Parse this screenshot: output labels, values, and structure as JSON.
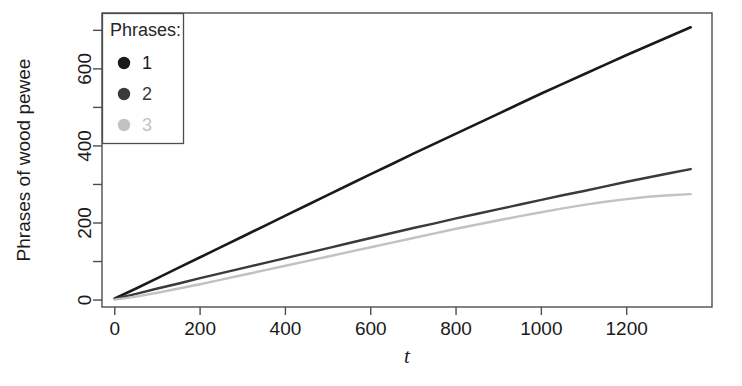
{
  "chart_data": {
    "type": "line",
    "title": "",
    "xlabel": "t",
    "ylabel": "Phrases of wood pewee",
    "xlim": [
      -30,
      1400
    ],
    "ylim": [
      -18,
      745
    ],
    "grid": false,
    "legend_position": "top-left",
    "legend_title": "Phrases:",
    "xticks": [
      0,
      200,
      400,
      600,
      800,
      1000,
      1200
    ],
    "xtick_labels": [
      "0",
      "200",
      "400",
      "600",
      "800",
      "1000",
      "1200"
    ],
    "yticks": [
      0,
      200,
      400,
      600
    ],
    "ytick_labels": [
      "0",
      "200",
      "400",
      "600"
    ],
    "yticks_minor": [
      100,
      300,
      500,
      700
    ],
    "series": [
      {
        "name": "1",
        "label": "1",
        "color": "#1a1a1a",
        "marker": "circle",
        "linewidth": 2.6,
        "x": [
          0,
          50,
          100,
          150,
          200,
          250,
          300,
          350,
          400,
          450,
          500,
          550,
          600,
          650,
          700,
          750,
          800,
          850,
          900,
          950,
          1000,
          1050,
          1100,
          1150,
          1200,
          1250,
          1300,
          1350
        ],
        "y": [
          4,
          30,
          57,
          84,
          111,
          138,
          165,
          192,
          219,
          246,
          273,
          300,
          327,
          353,
          380,
          406,
          432,
          458,
          484,
          510,
          536,
          561,
          586,
          611,
          636,
          660,
          684,
          708
        ]
      },
      {
        "name": "2",
        "label": "2",
        "color": "#3a3a3a",
        "marker": "circle",
        "linewidth": 2.4,
        "x": [
          0,
          50,
          100,
          150,
          200,
          250,
          300,
          350,
          400,
          450,
          500,
          550,
          600,
          650,
          700,
          750,
          800,
          850,
          900,
          950,
          1000,
          1050,
          1100,
          1150,
          1200,
          1250,
          1300,
          1350
        ],
        "y": [
          3,
          16,
          30,
          43,
          57,
          70,
          83,
          96,
          109,
          122,
          135,
          148,
          161,
          174,
          187,
          199,
          212,
          224,
          236,
          248,
          260,
          272,
          283,
          295,
          307,
          318,
          329,
          340
        ]
      },
      {
        "name": "3",
        "label": "3",
        "color": "#c2c2c2",
        "marker": "circle",
        "linewidth": 2.4,
        "x": [
          0,
          50,
          100,
          150,
          200,
          250,
          300,
          350,
          400,
          450,
          500,
          550,
          600,
          650,
          700,
          750,
          800,
          850,
          900,
          950,
          1000,
          1050,
          1100,
          1150,
          1200,
          1250,
          1300,
          1350
        ],
        "y": [
          1,
          9,
          19,
          30,
          41,
          53,
          65,
          77,
          89,
          101,
          113,
          125,
          137,
          149,
          161,
          173,
          185,
          196,
          207,
          218,
          228,
          238,
          247,
          255,
          262,
          268,
          272,
          275
        ]
      }
    ]
  },
  "axes": {
    "y_axis_title": "Phrases of wood pewee",
    "x_axis_title": "t"
  },
  "legend": {
    "title": "Phrases:",
    "entries": [
      {
        "label": "1",
        "color": "#1a1a1a"
      },
      {
        "label": "2",
        "color": "#3a3a3a"
      },
      {
        "label": "3",
        "color": "#c2c2c2"
      }
    ]
  }
}
